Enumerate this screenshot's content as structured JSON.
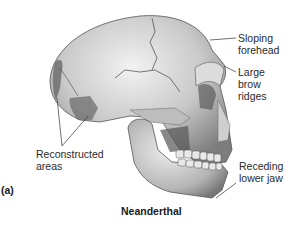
{
  "figure": {
    "panel_label": "(a)",
    "title": "Neanderthal",
    "labels": {
      "sloping_forehead": [
        "Sloping",
        "forehead"
      ],
      "large_brow_ridges": [
        "Large brow",
        "ridges"
      ],
      "reconstructed_areas": [
        "Reconstructed",
        "areas"
      ],
      "receding_lower_jaw": [
        "Receding",
        "lower jaw"
      ]
    }
  }
}
